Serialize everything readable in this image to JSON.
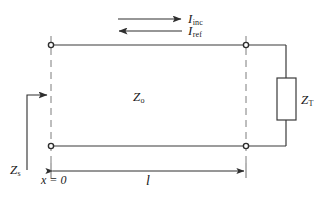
{
  "figure": {
    "type": "transmission-line-schematic",
    "width": 327,
    "height": 199,
    "background_color": "#ffffff",
    "line_color": "#3a3a3a",
    "text_color": "#1a1a1a"
  },
  "labels": {
    "incident_current": {
      "symbol": "I",
      "subscript": "inc"
    },
    "reflected_current": {
      "symbol": "I",
      "subscript": "ref"
    },
    "characteristic_impedance": {
      "symbol": "Z",
      "subscript": "o"
    },
    "terminating_impedance": {
      "symbol": "Z",
      "subscript": "T"
    },
    "source_impedance": {
      "symbol": "Z",
      "subscript": "s"
    },
    "origin": "x = 0",
    "length": "l"
  },
  "arrows": {
    "incident_direction": "right",
    "reflected_direction": "left",
    "length_dimension": "double-headed",
    "source_impedance_pointer": "right"
  },
  "components": {
    "load_box": {
      "name": "terminating-impedance-box"
    },
    "nodes": 4,
    "rails": 2
  }
}
